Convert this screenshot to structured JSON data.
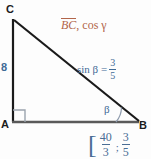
{
  "figure": {
    "type": "right-triangle-geometry-diagram",
    "vertices": {
      "top_left": "C",
      "bottom_left": "A",
      "bottom_right": "B"
    },
    "side_label_ac": "8",
    "angle_label_b": "β",
    "right_angle_at": "A"
  },
  "top_annotation": {
    "overlined_term": "BC",
    "rest": ", cos γ",
    "color": "#b2654a"
  },
  "given": {
    "sin_label": "sin β =",
    "numerator": "3",
    "denominator": "5",
    "color": "#3f6a96"
  },
  "answer": {
    "open_bracket": "[",
    "first_numerator": "40",
    "first_denominator": "3",
    "separator": ";",
    "second_numerator": "3",
    "second_denominator": "5",
    "color": "#4a6d95"
  },
  "colors": {
    "leg_line": "#1a1a1a",
    "base_line": "#5a5a5a",
    "hypotenuse_line": "#1a1a1a",
    "angle_arc": "#8e9bad",
    "right_angle_marker": "#9aa3ad",
    "background": "#fdfdfd"
  }
}
